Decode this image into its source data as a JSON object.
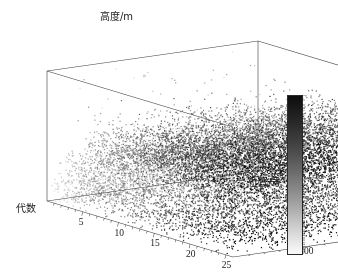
{
  "figure": {
    "background": "#ffffff",
    "width": 338,
    "height": 277
  },
  "chart_data": {
    "type": "scatter",
    "title": "",
    "subtitle": "",
    "projection": "3d",
    "xlabel": "代数",
    "ylabel": "位置/号",
    "zlabel": "高度/m",
    "xticks": [
      5,
      10,
      15,
      20,
      25
    ],
    "xtick_labels": [
      "5",
      "10",
      "15",
      "20",
      "25"
    ],
    "yticks": [
      200,
      400,
      600
    ],
    "ytick_labels": [
      "200",
      "400",
      "600"
    ],
    "zticks": [
      30,
      60,
      90,
      120
    ],
    "ztick_labels": [
      "30",
      "60",
      "90",
      "120"
    ],
    "xlim": [
      0,
      26
    ],
    "ylim": [
      0,
      700
    ],
    "zlim": [
      0,
      135
    ],
    "grid": false,
    "legend": false,
    "colormap": "gray_reversed",
    "color_mapped_variable": "代数",
    "colorbar": {
      "position": "right",
      "orientation": "vertical",
      "min_label": "1",
      "max_label": "141",
      "tick_labels": [
        "1",
        "4",
        "8",
        "12",
        "16",
        "20",
        "24",
        "28",
        "32",
        "36",
        "40",
        "44",
        "48",
        "52",
        "56",
        "60",
        "64",
        "68",
        "72",
        "76",
        "80",
        "84",
        "88",
        "92",
        "96",
        "100",
        "104",
        "108",
        "112",
        "116",
        "120",
        "124",
        "128",
        "132",
        "136",
        "141"
      ],
      "top_color": "#0d0d0d",
      "bottom_color": "#fafafa"
    },
    "point_count": 14000,
    "point_size": 1.2
  },
  "axes": {
    "box_line_color": "#3a3a3a",
    "tick_color": "#2b2b2b"
  }
}
